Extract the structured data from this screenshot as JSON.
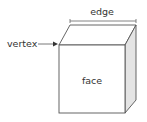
{
  "diagram": {
    "type": "cube-parts",
    "labels": {
      "edge": "edge",
      "vertex": "vertex",
      "face": "face"
    },
    "colors": {
      "stroke": "#555555",
      "side_fill": "#e4e4e4",
      "front_fill": "#ffffff",
      "text": "#333333"
    }
  }
}
